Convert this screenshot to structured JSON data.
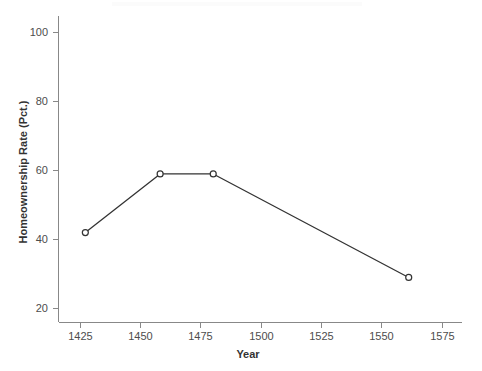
{
  "chart_data": {
    "type": "line",
    "title": "",
    "subtitle": "",
    "xlabel": "Year",
    "ylabel": "Homeownership Rate (Pct.)",
    "x": [
      1427,
      1458,
      1480,
      1561
    ],
    "values": [
      42,
      59,
      59,
      29
    ],
    "series": [
      {
        "name": "Homeownership Rate",
        "x": [
          1427,
          1458,
          1480,
          1561
        ],
        "values": [
          42,
          59,
          59,
          29
        ]
      }
    ],
    "xlim": [
      1415,
      1565
    ],
    "ylim": [
      17,
      104
    ],
    "xticks": [
      1425,
      1450,
      1475,
      1500,
      1525,
      1550,
      1575
    ],
    "xtick_labels": [
      "1425",
      "1450",
      "1475",
      "1500",
      "1525",
      "1550",
      "1575"
    ],
    "yticks": [
      20,
      40,
      60,
      80,
      100
    ],
    "ytick_labels": [
      "20",
      "40",
      "60",
      "80",
      "100"
    ],
    "grid": false,
    "legend": false,
    "legend_position": "none",
    "marker": "open-circle",
    "line_color": "#333333",
    "marker_face_color": "#ffffff",
    "marker_edge_color": "#333333",
    "axis_color": "#888888",
    "text_color": "#4d4d4d",
    "background_color": "#ffffff"
  },
  "axes": {
    "x_title": "Year",
    "y_title": "Homeownership Rate (Pct.)",
    "x_tick_labels": [
      "1425",
      "1450",
      "1475",
      "1500",
      "1525",
      "1550",
      "1575"
    ],
    "y_tick_labels": [
      "100",
      "80",
      "60",
      "40",
      "20"
    ]
  }
}
